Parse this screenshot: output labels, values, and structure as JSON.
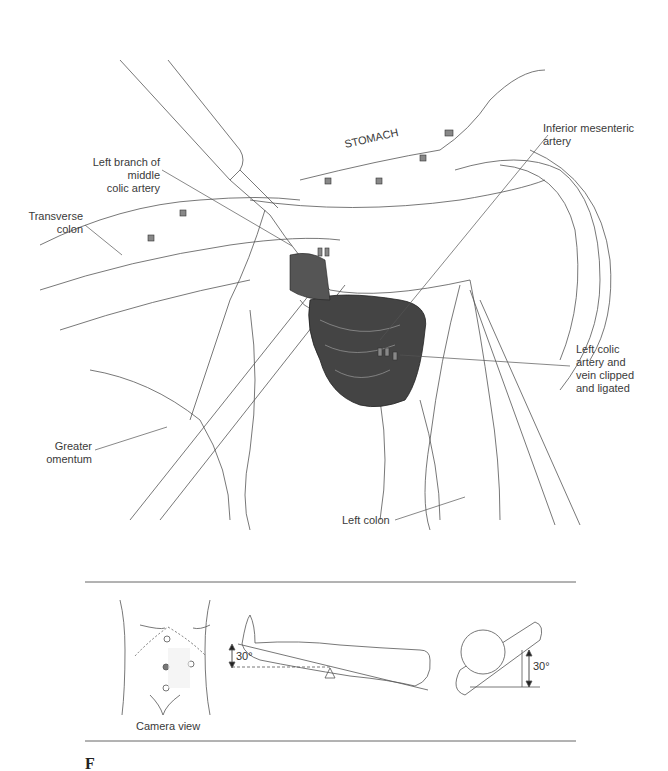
{
  "illustration": {
    "labels": {
      "stomach": "STOMACH",
      "middle_colic_line1": "Left branch of middle",
      "middle_colic_line2": "colic artery",
      "transverse_line1": "Transverse",
      "transverse_line2": "colon",
      "ima_line1": "Inferior mesenteric",
      "ima_line2": "artery",
      "left_colic_line1": "Left colic",
      "left_colic_line2": "artery and",
      "left_colic_line3": "vein clipped",
      "left_colic_line4": "and ligated",
      "omentum_line1": "Greater",
      "omentum_line2": "omentum",
      "left_colon": "Left colon"
    }
  },
  "inset": {
    "camera_caption": "Camera view",
    "tilt_angle_label": "30°",
    "rotation_angle_label": "30°"
  },
  "footer": {
    "caption_initial": "F"
  }
}
